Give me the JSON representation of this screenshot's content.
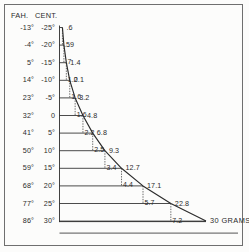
{
  "figure": {
    "headers": {
      "fahrenheit": "FAH.",
      "centigrade": "CENT."
    },
    "units_label": "30 GRAMS",
    "frame_color": "#6f6f6f",
    "ink_color": "#2b2b2b"
  },
  "chart_data": {
    "type": "bar",
    "title": "",
    "subtitle": "",
    "xlabel": "30 GRAMS",
    "ylabel": "",
    "grid": false,
    "legend": false,
    "orientation": "horizontal",
    "categories": [
      "-25",
      "-20",
      "-15",
      "-10",
      "-5",
      "0",
      "5",
      "10",
      "15",
      "20",
      "25",
      "30"
    ],
    "axis_fahrenheit": [
      "-13°",
      "-4°",
      "5°",
      "14°",
      "23°",
      "32°",
      "41°",
      "50°",
      "59°",
      "68°",
      "77°",
      "86°"
    ],
    "axis_centigrade": [
      "-25°",
      "-20°",
      "-15°",
      "-10°",
      "-5°",
      "0",
      "5°",
      "10°",
      "15°",
      "20°",
      "25°",
      "30°"
    ],
    "values": [
      0.6,
      0.9,
      1.4,
      2.1,
      3.2,
      4.8,
      6.8,
      9.3,
      12.7,
      17.1,
      22.8,
      30.0
    ],
    "value_labels": [
      ".6",
      ".9",
      "1.4",
      "2.1",
      "3.2",
      "4.8",
      "6.8",
      "9.3",
      "12.7",
      "17.1",
      "22.8",
      "30 GRAMS"
    ],
    "half_labels": [
      "",
      ".5",
      ".7",
      "1.0",
      "1.6",
      "1.6",
      "2.2",
      "2.5",
      "3.4",
      "4.4",
      "5.7",
      "7.2"
    ],
    "xlim": [
      0,
      30
    ],
    "ylim": [
      0,
      11
    ],
    "series": [
      {
        "name": "Grams of water vapour per cubic metre at saturation",
        "values": [
          0.6,
          0.9,
          1.4,
          2.1,
          3.2,
          4.8,
          6.8,
          9.3,
          12.7,
          17.1,
          22.8,
          30.0
        ]
      }
    ]
  }
}
